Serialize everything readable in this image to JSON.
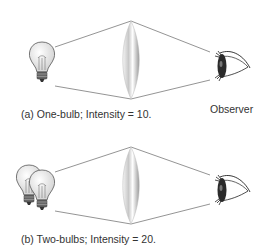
{
  "panels": [
    {
      "id": "a",
      "caption": "(a) One-bulb; Intensity = 10.",
      "bulbs": 1,
      "intensity": 10
    },
    {
      "id": "b",
      "caption": "(b) Two-bulbs; Intensity = 20.",
      "bulbs": 2,
      "intensity": 20
    }
  ],
  "labels": {
    "observer": "Observer"
  },
  "icons": {
    "light_source": "light-bulb-icon",
    "lens": "convex-lens-icon",
    "observer": "eye-icon"
  }
}
